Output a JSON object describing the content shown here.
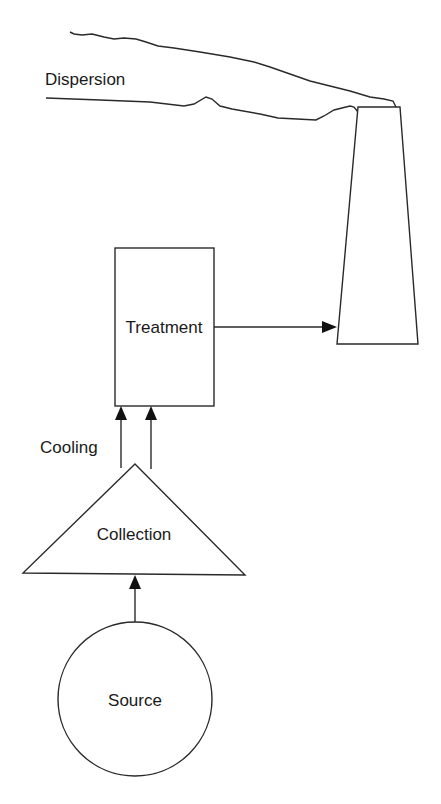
{
  "diagram": {
    "type": "process-flow",
    "nodes": [
      {
        "id": "source",
        "label": "Source",
        "shape": "circle"
      },
      {
        "id": "collection",
        "label": "Collection",
        "shape": "triangle"
      },
      {
        "id": "treatment",
        "label": "Treatment",
        "shape": "rectangle"
      },
      {
        "id": "stack",
        "label": "",
        "shape": "trapezoid-stack"
      },
      {
        "id": "dispersion",
        "label": "Dispersion",
        "shape": "plume"
      }
    ],
    "edges": [
      {
        "from": "source",
        "to": "collection",
        "label": ""
      },
      {
        "from": "collection",
        "to": "treatment",
        "label": "Cooling",
        "count": 2
      },
      {
        "from": "treatment",
        "to": "stack",
        "label": ""
      },
      {
        "from": "stack",
        "to": "dispersion",
        "label": ""
      }
    ]
  },
  "labels": {
    "dispersion": "Dispersion",
    "treatment": "Treatment",
    "cooling": "Cooling",
    "collection": "Collection",
    "source": "Source"
  },
  "colors": {
    "line": "#2a2a2a",
    "background": "#ffffff"
  }
}
